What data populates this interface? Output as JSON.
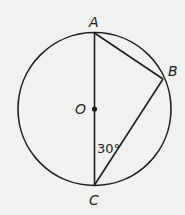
{
  "diagram": {
    "type": "circle-geometry",
    "circle": {
      "center_label": "O",
      "cx": 94.5,
      "cy": 109,
      "r": 76.5
    },
    "points": [
      {
        "id": "A",
        "label": "A",
        "x": 94.5,
        "y": 33
      },
      {
        "id": "B",
        "label": "B",
        "x": 163,
        "y": 79
      },
      {
        "id": "C",
        "label": "C",
        "x": 94.5,
        "y": 185
      },
      {
        "id": "O",
        "label": "O",
        "x": 94.5,
        "y": 109
      }
    ],
    "segments": [
      {
        "from": "A",
        "to": "C",
        "note": "diameter through O"
      },
      {
        "from": "A",
        "to": "B"
      },
      {
        "from": "B",
        "to": "C"
      }
    ],
    "angle_annotation": {
      "vertex": "C",
      "between": [
        "A",
        "B"
      ],
      "label": "30°"
    },
    "colors": {
      "stroke": "#1e1e1e",
      "background": "#f1f1f0"
    }
  }
}
